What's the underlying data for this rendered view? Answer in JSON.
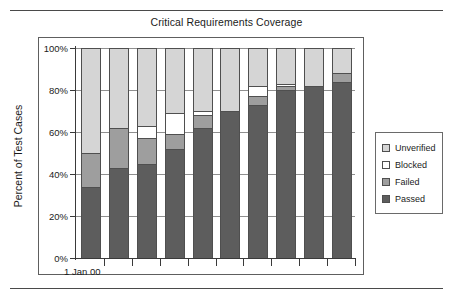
{
  "chart_data": {
    "type": "bar",
    "title": "Critical Requirements Coverage",
    "subtitle": "",
    "xlabel": "",
    "ylabel": "Percent of Test Cases",
    "ylim": [
      0,
      100
    ],
    "yticks": [
      "0%",
      "20%",
      "40%",
      "60%",
      "80%",
      "100%"
    ],
    "ytick_values": [
      0,
      20,
      40,
      60,
      80,
      100
    ],
    "grid": true,
    "stacked": true,
    "legend_position": "right",
    "x_axis_caption": "1 Jan 00",
    "categories": [
      "1",
      "2",
      "3",
      "4",
      "5",
      "6",
      "7",
      "8",
      "9",
      "10"
    ],
    "series": [
      {
        "name": "Passed",
        "color": "#5d5d5d",
        "values": [
          34,
          43,
          45,
          52,
          62,
          70,
          73,
          80,
          82,
          84
        ]
      },
      {
        "name": "Failed",
        "color": "#9e9e9e",
        "values": [
          16,
          19,
          12,
          7,
          6,
          0,
          4,
          2,
          0,
          4
        ]
      },
      {
        "name": "Blocked",
        "color": "#ffffff",
        "values": [
          0,
          0,
          6,
          10,
          2,
          0,
          5,
          1,
          0,
          0
        ]
      },
      {
        "name": "Unverified",
        "color": "#d5d5d5",
        "values": [
          50,
          38,
          37,
          31,
          30,
          30,
          18,
          17,
          18,
          12
        ]
      }
    ],
    "legend": [
      {
        "label": "Unverified",
        "swatch": "#d5d5d5"
      },
      {
        "label": "Blocked",
        "swatch": "#ffffff"
      },
      {
        "label": "Failed",
        "swatch": "#9e9e9e"
      },
      {
        "label": "Passed",
        "swatch": "#5d5d5d"
      }
    ]
  }
}
